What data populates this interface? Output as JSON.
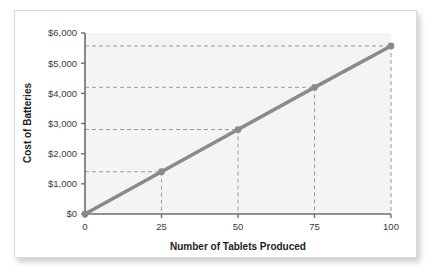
{
  "figure": {
    "background_color": "#ffffff",
    "card_color": "#ffffff",
    "plot_area_color": "#f4f4f4",
    "line_color": "#8a8a8a",
    "marker_color": "#8a8a8a",
    "axis_color": "#6e6e6e",
    "dashed_guide_color": "#9a9a9a",
    "text_color": "#1d1d1d"
  },
  "chart_data": {
    "type": "line",
    "title": "",
    "xlabel": "Number of Tablets Produced",
    "ylabel": "Cost of Batteries",
    "x": [
      0,
      25,
      50,
      75,
      100
    ],
    "values": [
      0,
      1400,
      2800,
      4200,
      5570
    ],
    "series": [
      {
        "name": "Cost of Batteries",
        "values": [
          0,
          1400,
          2800,
          4200,
          5570
        ]
      }
    ],
    "xlim": [
      0,
      100
    ],
    "ylim": [
      0,
      6000
    ],
    "xticks": [
      0,
      25,
      50,
      75,
      100
    ],
    "xtick_labels": [
      "0",
      "25",
      "50",
      "75",
      "100"
    ],
    "yticks": [
      0,
      1000,
      2000,
      3000,
      4000,
      5000,
      6000
    ],
    "ytick_labels": [
      "$0",
      "$1,000",
      "$2,000",
      "$3,000",
      "$4,000",
      "$5,000",
      "$6,000"
    ],
    "grid": false,
    "legend": null,
    "markers": [
      {
        "x": 25,
        "y": 1400,
        "guide": true
      },
      {
        "x": 50,
        "y": 2800,
        "guide": true
      },
      {
        "x": 75,
        "y": 4200,
        "guide": true
      },
      {
        "x": 100,
        "y": 5570,
        "guide": true
      }
    ],
    "annotations": []
  }
}
